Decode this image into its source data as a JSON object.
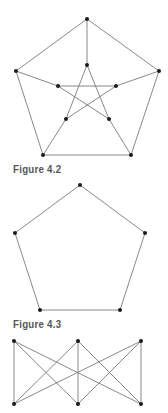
{
  "figures": [
    {
      "caption": "Figure 4.2",
      "graph": "petersen",
      "nodes": [
        {
          "id": "o0",
          "x": 87,
          "y": 19
        },
        {
          "id": "o1",
          "x": 159,
          "y": 71
        },
        {
          "id": "o2",
          "x": 131,
          "y": 155
        },
        {
          "id": "o3",
          "x": 43,
          "y": 155
        },
        {
          "id": "o4",
          "x": 16,
          "y": 71
        },
        {
          "id": "i0",
          "x": 87,
          "y": 65
        },
        {
          "id": "i1",
          "x": 116,
          "y": 86
        },
        {
          "id": "i2",
          "x": 109,
          "y": 119
        },
        {
          "id": "i3",
          "x": 66,
          "y": 119
        },
        {
          "id": "i4",
          "x": 58,
          "y": 86
        }
      ],
      "edges": [
        [
          "o0",
          "o1"
        ],
        [
          "o1",
          "o2"
        ],
        [
          "o2",
          "o3"
        ],
        [
          "o3",
          "o4"
        ],
        [
          "o4",
          "o0"
        ],
        [
          "o0",
          "i0"
        ],
        [
          "o1",
          "i1"
        ],
        [
          "o2",
          "i2"
        ],
        [
          "o3",
          "i3"
        ],
        [
          "o4",
          "i4"
        ],
        [
          "i0",
          "i2"
        ],
        [
          "i2",
          "i4"
        ],
        [
          "i4",
          "i1"
        ],
        [
          "i1",
          "i3"
        ],
        [
          "i3",
          "i0"
        ]
      ]
    },
    {
      "caption": "Figure 4.3",
      "graph": "cycle-5",
      "nodes": [
        {
          "id": "p0",
          "x": 80,
          "y": 185
        },
        {
          "id": "p1",
          "x": 145,
          "y": 233
        },
        {
          "id": "p2",
          "x": 120,
          "y": 310
        },
        {
          "id": "p3",
          "x": 40,
          "y": 310
        },
        {
          "id": "p4",
          "x": 15,
          "y": 233
        }
      ],
      "edges": [
        [
          "p0",
          "p1"
        ],
        [
          "p1",
          "p2"
        ],
        [
          "p2",
          "p3"
        ],
        [
          "p3",
          "p4"
        ],
        [
          "p4",
          "p0"
        ]
      ]
    },
    {
      "caption": "",
      "graph": "K3,3",
      "nodes": [
        {
          "id": "a0",
          "x": 14,
          "y": 341
        },
        {
          "id": "a1",
          "x": 78,
          "y": 341
        },
        {
          "id": "a2",
          "x": 141,
          "y": 341
        },
        {
          "id": "b0",
          "x": 14,
          "y": 404
        },
        {
          "id": "b1",
          "x": 78,
          "y": 404
        },
        {
          "id": "b2",
          "x": 141,
          "y": 404
        }
      ],
      "edges": [
        [
          "a0",
          "b0"
        ],
        [
          "a0",
          "b1"
        ],
        [
          "a0",
          "b2"
        ],
        [
          "a1",
          "b0"
        ],
        [
          "a1",
          "b1"
        ],
        [
          "a1",
          "b2"
        ],
        [
          "a2",
          "b0"
        ],
        [
          "a2",
          "b1"
        ],
        [
          "a2",
          "b2"
        ]
      ]
    }
  ],
  "captions": {
    "fig42": "Figure 4.2",
    "fig43": "Figure 4.3"
  },
  "colors": {
    "edge": "#7a7a7a",
    "node": "#1a1a1a",
    "caption": "#555555",
    "background": "#ffffff"
  }
}
